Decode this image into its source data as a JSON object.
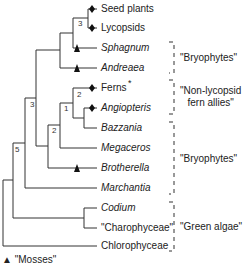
{
  "taxa": [
    {
      "label": "Seed plants",
      "italic": false,
      "y": 9,
      "marker": "diamond"
    },
    {
      "label": "Lycopsids",
      "italic": false,
      "y": 28,
      "marker": "diamond"
    },
    {
      "label": "Sphagnum",
      "italic": true,
      "y": 48,
      "marker": "triangle"
    },
    {
      "label": "Andreaea",
      "italic": true,
      "y": 68,
      "marker": "triangle"
    },
    {
      "label": "Ferns",
      "italic": false,
      "y": 88,
      "marker": "diamond",
      "superscript": "*"
    },
    {
      "label": "Angiopteris",
      "italic": true,
      "y": 108,
      "marker": "diamond"
    },
    {
      "label": "Bazzania",
      "italic": true,
      "y": 128,
      "marker": "none"
    },
    {
      "label": "Megaceros",
      "italic": true,
      "y": 148,
      "marker": "none"
    },
    {
      "label": "Brotherella",
      "italic": true,
      "y": 168,
      "marker": "triangle"
    },
    {
      "label": "Marchantia",
      "italic": true,
      "y": 188,
      "marker": "none"
    },
    {
      "label": "Codium",
      "italic": true,
      "y": 208,
      "marker": "none"
    },
    {
      "label": "\"Charophyceae\"",
      "italic": false,
      "y": 228,
      "marker": "none"
    },
    {
      "label": "Chlorophyceae",
      "italic": false,
      "y": 246,
      "marker": "none"
    }
  ],
  "groups": [
    {
      "label": "\"Bryophytes\"",
      "top": 42,
      "bottom": 73
    },
    {
      "label": "\"Non-lycopsid\nfern allies\"",
      "top": 80,
      "bottom": 114
    },
    {
      "label": "\"Bryophytes\"",
      "top": 122,
      "bottom": 194
    },
    {
      "label": "\"Green algae\"",
      "top": 202,
      "bottom": 251
    }
  ],
  "node_support": [
    "3",
    "3",
    "2",
    "1",
    "2",
    "5"
  ],
  "legend": {
    "symbol": "▲",
    "label": "\"Mosses\""
  }
}
